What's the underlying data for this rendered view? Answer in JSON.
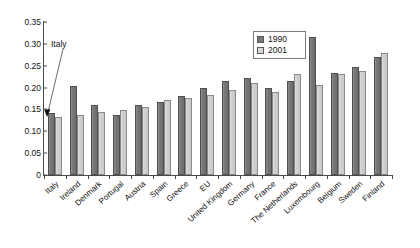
{
  "chart_data": {
    "type": "bar",
    "title": "",
    "subtitle": "",
    "xlabel": "",
    "ylabel": "",
    "ylim": [
      0,
      0.35
    ],
    "yticks": [
      "0",
      "0.05",
      "0.10",
      "0.15",
      "0.20",
      "0.25",
      "0.30",
      "0.35"
    ],
    "ytick_values": [
      0,
      0.05,
      0.1,
      0.15,
      0.2,
      0.25,
      0.3,
      0.35
    ],
    "grid": false,
    "legend_position": "top-right",
    "categories": [
      "Italy",
      "Ireland",
      "Denmark",
      "Portugal",
      "Austria",
      "Spain",
      "Greece",
      "EU",
      "United Kingdom",
      "Germany",
      "France",
      "The Netherlands",
      "Luxembourg",
      "Belgium",
      "Sweden",
      "Finland"
    ],
    "series": [
      {
        "name": "1990",
        "color": "#777777",
        "values": [
          0.141,
          0.204,
          0.161,
          0.138,
          0.16,
          0.166,
          0.18,
          0.2,
          0.216,
          0.222,
          0.2,
          0.216,
          0.315,
          0.234,
          0.247,
          0.27
        ]
      },
      {
        "name": "2001",
        "color": "#d8d8d8",
        "values": [
          0.133,
          0.137,
          0.144,
          0.149,
          0.156,
          0.172,
          0.176,
          0.182,
          0.194,
          0.211,
          0.19,
          0.23,
          0.207,
          0.23,
          0.238,
          0.28
        ]
      }
    ],
    "annotations": [
      {
        "text": "Italy",
        "points_to_category": "Italy",
        "points_to_series": "1990"
      }
    ]
  },
  "legend": {
    "items": [
      {
        "label": "1990"
      },
      {
        "label": "2001"
      }
    ]
  },
  "annotation": {
    "label": "Italy"
  }
}
